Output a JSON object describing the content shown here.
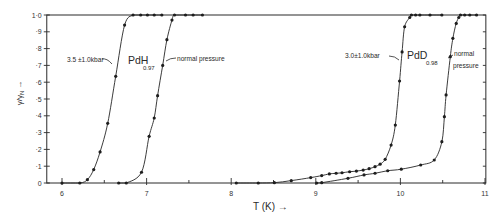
{
  "chart_data": {
    "type": "line",
    "title": "",
    "xlabel": "T (K) →",
    "ylabel": "γ/γ",
    "ylabel_subscript": "N",
    "ylabel_arrow": "→",
    "xlim": [
      5.82,
      11.01
    ],
    "ylim": [
      0,
      1.0
    ],
    "xticks": [
      6,
      7,
      8,
      9,
      10,
      11
    ],
    "xtick_labels": [
      "6",
      "7",
      "8",
      "9",
      "10",
      "11"
    ],
    "xminor_ticks": [
      6.5,
      7.5,
      8.5,
      9.5,
      10.5
    ],
    "yticks": [
      0,
      0.1,
      0.2,
      0.3,
      0.4,
      0.5,
      0.6,
      0.7,
      0.8,
      0.9,
      1.0
    ],
    "ytick_labels": [
      "0",
      "·1",
      "·2",
      "·3",
      "·4",
      "·5",
      "·6",
      "·7",
      "·8",
      "·9",
      "1·0"
    ],
    "grid": false,
    "legend": "none (curves labelled directly)",
    "series": [
      {
        "name": "PdH0.97 — 3.5 ±1.0 kbar",
        "x": [
          6.0,
          6.21,
          6.3,
          6.375,
          6.45,
          6.54,
          6.635,
          6.74,
          6.84,
          6.93,
          7.01,
          7.09,
          7.18
        ],
        "y": [
          0,
          0,
          0.02,
          0.08,
          0.185,
          0.355,
          0.635,
          0.94,
          1.0,
          1.0,
          1.0,
          1.0,
          1.0
        ]
      },
      {
        "name": "PdH0.97 — normal pressure",
        "x": [
          6.67,
          6.76,
          6.94,
          7.03,
          7.09,
          7.13,
          7.19,
          7.24,
          7.3,
          7.33,
          7.46,
          7.55,
          7.66
        ],
        "y": [
          0,
          0,
          0.064,
          0.278,
          0.387,
          0.52,
          0.7,
          0.853,
          0.97,
          1.0,
          1.0,
          1.0,
          1.0
        ]
      },
      {
        "name": "PdD0.98 — 3.0 ±1.0 kbar",
        "x": [
          8.06,
          8.32,
          8.51,
          8.71,
          8.94,
          9.07,
          9.16,
          9.24,
          9.31,
          9.4,
          9.48,
          9.56,
          9.63,
          9.7,
          9.76,
          9.82,
          9.89,
          9.94,
          9.99,
          10.02,
          10.05,
          10.11,
          10.13,
          10.18,
          10.23,
          10.35,
          10.49
        ],
        "y": [
          0,
          0,
          0.002,
          0.014,
          0.032,
          0.044,
          0.054,
          0.058,
          0.061,
          0.067,
          0.071,
          0.077,
          0.085,
          0.097,
          0.112,
          0.141,
          0.226,
          0.345,
          0.607,
          0.78,
          0.93,
          0.985,
          1.0,
          1.0,
          1.0,
          1.0,
          1.0
        ]
      },
      {
        "name": "PdD0.98 — normal pressure",
        "x": [
          9.01,
          9.07,
          9.38,
          9.57,
          9.7,
          9.85,
          10.01,
          10.24,
          10.4,
          10.49,
          10.52,
          10.54,
          10.59,
          10.62,
          10.66,
          10.69,
          10.71,
          10.76,
          10.82,
          10.9
        ],
        "y": [
          0,
          0.002,
          0.028,
          0.048,
          0.058,
          0.073,
          0.082,
          0.107,
          0.137,
          0.246,
          0.395,
          0.524,
          0.752,
          0.861,
          0.95,
          0.985,
          1.0,
          1.0,
          1.0,
          1.0
        ]
      }
    ],
    "annotations": {
      "pdh_pressure": "3.5 ±1.0kbar",
      "pdh_compound": "PdH",
      "pdh_subscript": "0.97",
      "pdh_normal": "normal pressure",
      "pdd_pressure": "3.0±1.0kbar",
      "pdd_compound": "PdD",
      "pdd_subscript": "0.98",
      "pdd_normal_line1": "normal",
      "pdd_normal_line2": "pressure"
    }
  }
}
